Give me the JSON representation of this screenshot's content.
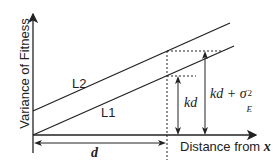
{
  "diagram": {
    "y_axis_label": "Variance of Fitness",
    "x_axis_label": "Distance from ",
    "x_axis_var": "x",
    "lines": [
      {
        "name": "L1",
        "label": "L1"
      },
      {
        "name": "L2",
        "label": "L2"
      }
    ],
    "distance_label": "d",
    "kd_label": "kd",
    "kd_sigma_label": "kd + σ",
    "sigma_sup": "2",
    "sigma_sub": "E"
  }
}
